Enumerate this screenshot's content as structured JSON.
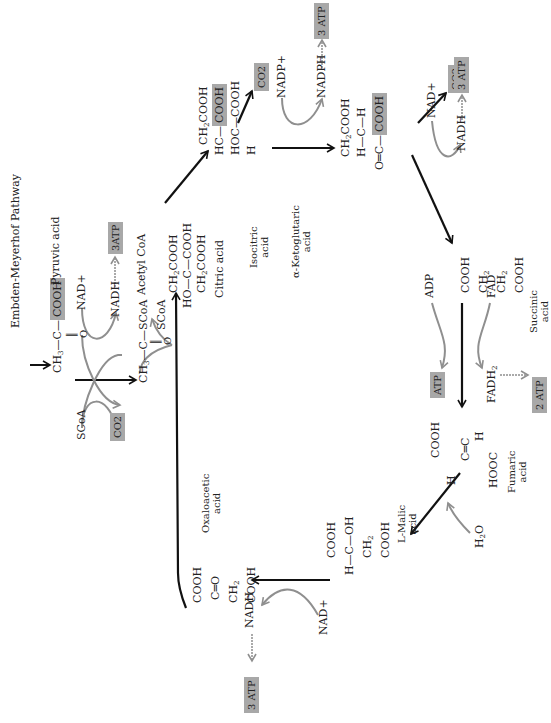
{
  "title": "Embden-Meyerhof Pathway",
  "diagram": {
    "type": "Krebs (citric acid) cycle",
    "orientation": "rotated 90 degrees counter-clockwise",
    "accent_box_color": "#a8a8a8",
    "main_arrow_color": "#111111",
    "side_arrow_color": "#8f8f8f"
  },
  "compounds": {
    "pyruvic": {
      "name": "Pyruvic acid",
      "formula_main": "CH3—C—COOH",
      "ch3": "CH",
      "ch3_sub": "3",
      "c": "—C—",
      "cooh": "COOH",
      "oxo": "O"
    },
    "acetyl_coa": {
      "name": "Acetyl CoA",
      "ch3": "CH",
      "ch3_sub": "3",
      "c": "—C—SCoA",
      "oxo": "O"
    },
    "citric": {
      "name": "Citric acid",
      "r1": "CH2COOH",
      "r2": "HO—C—COOH",
      "r3": "CH2COOH"
    },
    "isocitric": {
      "name": "Isocitric",
      "name2": "acid",
      "r1": "CH2COOH",
      "r2a": "HC—",
      "r2b": "COOH",
      "r3": "HOC—COOH",
      "r4": "H"
    },
    "ketoglutaric": {
      "name": "α-Ketoglutaric",
      "name2": "acid",
      "r1": "CH2COOH",
      "r2": "H—C—H",
      "r3a": "O═C—",
      "r3b": "COOH"
    },
    "succinic": {
      "name": "Succinic",
      "name2": "acid",
      "r1": "COOH",
      "r2": "CH2",
      "r3": "CH2",
      "r4": "COOH"
    },
    "fumaric": {
      "name": "Fumaric",
      "name2": "acid",
      "r1": "COOH",
      "r2": "H    C═C    H",
      "r3": "HOOC"
    },
    "malic": {
      "name": "L-Malic",
      "name2": "acid",
      "r1": "COOH",
      "r2": "H—C—OH",
      "r3": "CH2",
      "r4": "COOH"
    },
    "oxaloacetic": {
      "name": "Oxaloacetic",
      "name2": "acid",
      "r1": "COOH",
      "r2": "C═O",
      "r3": "CH2",
      "r4": "COOH"
    }
  },
  "cofactors": {
    "scoa_in": "SCoA",
    "nad_plus_1": "NAD+",
    "nadh_1": "NADH",
    "atp_1": "3ATP",
    "co2_1": "CO2",
    "scoa_out": "SCoA",
    "co2_2": "CO2",
    "nadp_plus": "NADP+",
    "nadph": "NADPH",
    "atp_2": "3 ATP",
    "co2_3": "CO2",
    "nad_plus_3": "NAD+",
    "nadh_3": "NADH",
    "atp_3": "3 ATP",
    "adp": "ADP",
    "atp_4": "ATP",
    "fad": "FAD",
    "fadh2": "FADH2",
    "atp_5": "2 ATP",
    "h2o": "H2O",
    "nad_plus_6": "NAD+",
    "nadh_6": "NADH",
    "atp_6": "3 ATP"
  }
}
